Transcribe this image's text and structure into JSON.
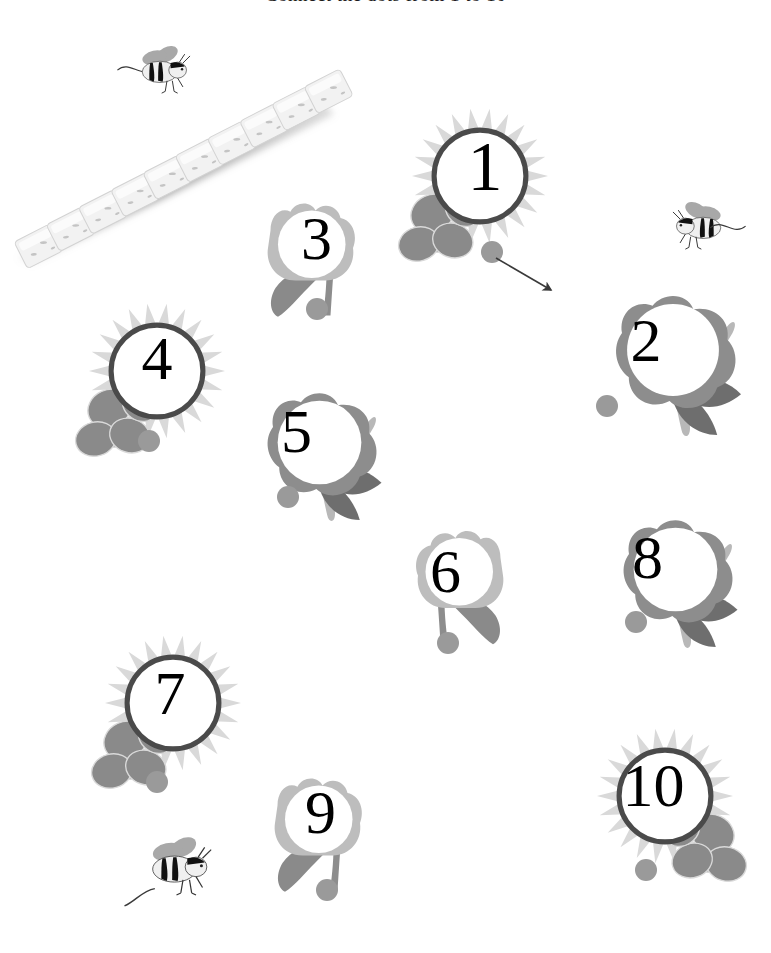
{
  "page": {
    "width": 771,
    "height": 953,
    "background": "#ffffff",
    "title_partial": "Connect the dots from 1 to 10",
    "worksheet_type": "connect-the-dots counting activity"
  },
  "palette": {
    "dot_gray": "#9a9a9a",
    "petal_light": "#d9d9d9",
    "petal_mid": "#bdbdbd",
    "petal_dark": "#8d8d8d",
    "leaf_dark": "#6e6e6e",
    "leaf_mid": "#8a8a8a",
    "stem_light": "#b8b8b8",
    "outline_dark": "#4a4a4a",
    "number_color": "#000000",
    "bee_body": "#f0f0f0",
    "bee_stripe": "#111111",
    "bee_wing": "#a8a8a8",
    "cube_face": "#f2f2f2",
    "cube_shadow": "#9b9b9b"
  },
  "flowers": [
    {
      "id": "flower-1",
      "number": "1",
      "kind": "sunflower",
      "x": 395,
      "y": 98,
      "w": 170,
      "h": 190,
      "num_x": 455,
      "num_y": 122,
      "num_w": 60,
      "num_h": 90,
      "num_size": 70,
      "dot_x": 492,
      "dot_y": 252,
      "dot_r": 11,
      "has_pencil_mark": true,
      "leaf_side": "left"
    },
    {
      "id": "flower-2",
      "number": "2",
      "kind": "rose",
      "x": 588,
      "y": 282,
      "w": 170,
      "h": 170,
      "num_x": 616,
      "num_y": 305,
      "num_w": 60,
      "num_h": 70,
      "num_size": 62,
      "dot_x": 607,
      "dot_y": 406,
      "dot_r": 11,
      "has_pencil_mark": false,
      "leaf_side": "right"
    },
    {
      "id": "flower-3",
      "number": "3",
      "kind": "tulip",
      "x": 248,
      "y": 178,
      "w": 125,
      "h": 160,
      "num_x": 289,
      "num_y": 203,
      "num_w": 55,
      "num_h": 70,
      "num_size": 62,
      "dot_x": 317,
      "dot_y": 309,
      "dot_r": 11,
      "has_pencil_mark": false,
      "leaf_side": "left"
    },
    {
      "id": "flower-4",
      "number": "4",
      "kind": "sunflower",
      "x": 72,
      "y": 293,
      "w": 170,
      "h": 190,
      "num_x": 127,
      "num_y": 318,
      "num_w": 60,
      "num_h": 80,
      "num_size": 62,
      "dot_x": 149,
      "dot_y": 441,
      "dot_r": 11,
      "has_pencil_mark": false,
      "leaf_side": "left"
    },
    {
      "id": "flower-5",
      "number": "5",
      "kind": "rose",
      "x": 242,
      "y": 378,
      "w": 155,
      "h": 160,
      "num_x": 269,
      "num_y": 396,
      "num_w": 55,
      "num_h": 70,
      "num_size": 62,
      "dot_x": 288,
      "dot_y": 497,
      "dot_r": 11,
      "has_pencil_mark": false,
      "leaf_side": "right"
    },
    {
      "id": "flower-6",
      "number": "6",
      "kind": "tulip",
      "x": 398,
      "y": 508,
      "w": 125,
      "h": 155,
      "num_x": 418,
      "num_y": 536,
      "num_w": 55,
      "num_h": 70,
      "num_size": 62,
      "dot_x": 448,
      "dot_y": 643,
      "dot_r": 11,
      "has_pencil_mark": false,
      "leaf_side": "right"
    },
    {
      "id": "flower-8",
      "number": "8",
      "kind": "rose",
      "x": 598,
      "y": 505,
      "w": 155,
      "h": 160,
      "num_x": 620,
      "num_y": 522,
      "num_w": 55,
      "num_h": 70,
      "num_size": 62,
      "dot_x": 636,
      "dot_y": 622,
      "dot_r": 11,
      "has_pencil_mark": false,
      "leaf_side": "right"
    },
    {
      "id": "flower-7",
      "number": "7",
      "kind": "sunflower",
      "x": 88,
      "y": 625,
      "w": 170,
      "h": 190,
      "num_x": 140,
      "num_y": 653,
      "num_w": 60,
      "num_h": 80,
      "num_size": 62,
      "dot_x": 157,
      "dot_y": 782,
      "dot_r": 11,
      "has_pencil_mark": false,
      "leaf_side": "left"
    },
    {
      "id": "flower-9",
      "number": "9",
      "kind": "tulip",
      "x": 255,
      "y": 753,
      "w": 125,
      "h": 160,
      "num_x": 293,
      "num_y": 777,
      "num_w": 55,
      "num_h": 70,
      "num_size": 62,
      "dot_x": 327,
      "dot_y": 890,
      "dot_r": 11,
      "has_pencil_mark": false,
      "leaf_side": "left"
    },
    {
      "id": "flower-10",
      "number": "10",
      "kind": "sunflower",
      "x": 580,
      "y": 718,
      "w": 170,
      "h": 190,
      "num_x": 611,
      "num_y": 745,
      "num_w": 85,
      "num_h": 80,
      "num_size": 62,
      "dot_x": 646,
      "dot_y": 870,
      "dot_r": 11,
      "has_pencil_mark": false,
      "leaf_side": "right"
    }
  ],
  "bees": [
    {
      "id": "bee-top-left",
      "x": 112,
      "y": 40,
      "w": 110,
      "h": 62,
      "facing": "right",
      "trail": "left"
    },
    {
      "id": "bee-right",
      "x": 636,
      "y": 196,
      "w": 120,
      "h": 62,
      "facing": "left",
      "trail": "right"
    },
    {
      "id": "bee-bottom",
      "x": 118,
      "y": 828,
      "w": 130,
      "h": 80,
      "facing": "right",
      "trail": "down-left"
    }
  ],
  "cube_chain": {
    "id": "linking-cubes",
    "x": 4,
    "y": 62,
    "w": 350,
    "h": 200,
    "cube_count": 10,
    "orientation": "diagonal ascending left-to-right",
    "description": "chain of white linking cubes with soft shadow"
  },
  "pencil_mark": {
    "id": "started-line-from-dot-1",
    "from_x": 496,
    "from_y": 258,
    "to_x": 551,
    "to_y": 290,
    "color": "#3a3a3a",
    "has_arrowhead": true
  }
}
